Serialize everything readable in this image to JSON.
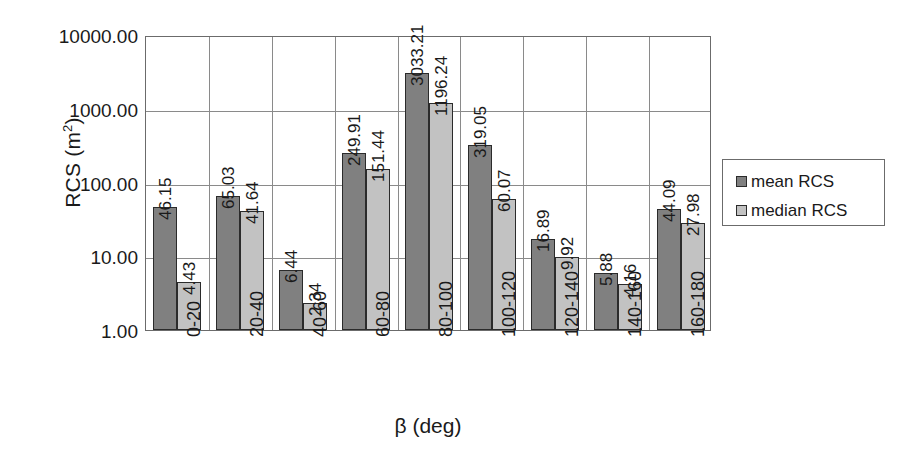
{
  "chart_data": {
    "type": "bar",
    "title": "",
    "xlabel": "β (deg)",
    "ylabel_text": "RCS (m",
    "ylabel_sup": "2",
    "ylabel_tail": ")",
    "yscale": "log",
    "ylim": [
      1,
      10000
    ],
    "grid": "horizontal-and-vertical",
    "legend_position": "right",
    "categories": [
      "0-20",
      "20-40",
      "40-60",
      "60-80",
      "80-100",
      "100-120",
      "120-140",
      "140-160",
      "160-180"
    ],
    "y_ticks": [
      {
        "value": 10000,
        "label": "10000.00"
      },
      {
        "value": 1000,
        "label": "1000.00"
      },
      {
        "value": 100,
        "label": "100.00"
      },
      {
        "value": 10,
        "label": "10.00"
      },
      {
        "value": 1,
        "label": "1.00"
      }
    ],
    "series": [
      {
        "name": "mean RCS",
        "color": "#808080",
        "values": [
          46.15,
          65.03,
          6.44,
          249.91,
          3033.21,
          319.05,
          16.89,
          5.88,
          44.09
        ],
        "labels": [
          "46.15",
          "65.03",
          "6.44",
          "249.91",
          "3033.21",
          "319.05",
          "16.89",
          "5.88",
          "44.09"
        ]
      },
      {
        "name": "median RCS",
        "color": "#c2c2c2",
        "values": [
          4.43,
          41.64,
          2.34,
          151.44,
          1196.24,
          60.07,
          9.92,
          4.16,
          27.98
        ],
        "labels": [
          "4.43",
          "41.64",
          "2.34",
          "151.44",
          "1196.24",
          "60.07",
          "9.92",
          "4.16",
          "27.98"
        ]
      }
    ]
  },
  "legend": {
    "items": [
      {
        "label": "mean RCS"
      },
      {
        "label": "median RCS"
      }
    ]
  }
}
